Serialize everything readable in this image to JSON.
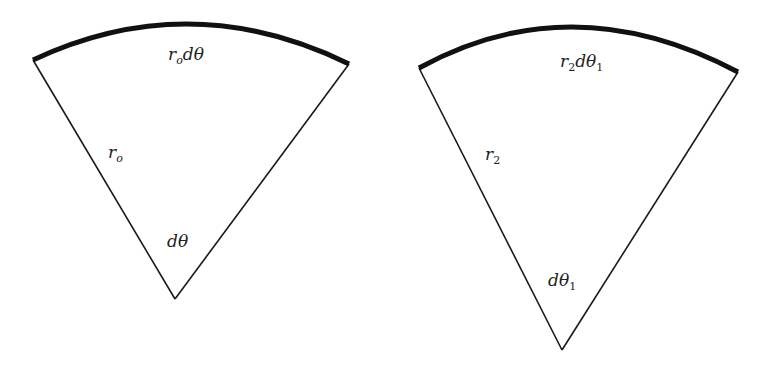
{
  "figures": [
    {
      "name": "sector-left",
      "arc_label": {
        "main": "r",
        "sub": "o",
        "tail": "dθ"
      },
      "radius_label": {
        "main": "r",
        "sub": "o"
      },
      "angle_label": {
        "main": "dθ",
        "sub": ""
      }
    },
    {
      "name": "sector-right",
      "arc_label": {
        "main": "r",
        "sub": "2",
        "tail": "dθ",
        "tail_sub": "1"
      },
      "radius_label": {
        "main": "r",
        "sub": "2"
      },
      "angle_label": {
        "main": "dθ",
        "sub": "1"
      }
    }
  ],
  "colors": {
    "line": "#1a1a1a",
    "arc": "#111111",
    "background": "#ffffff"
  }
}
